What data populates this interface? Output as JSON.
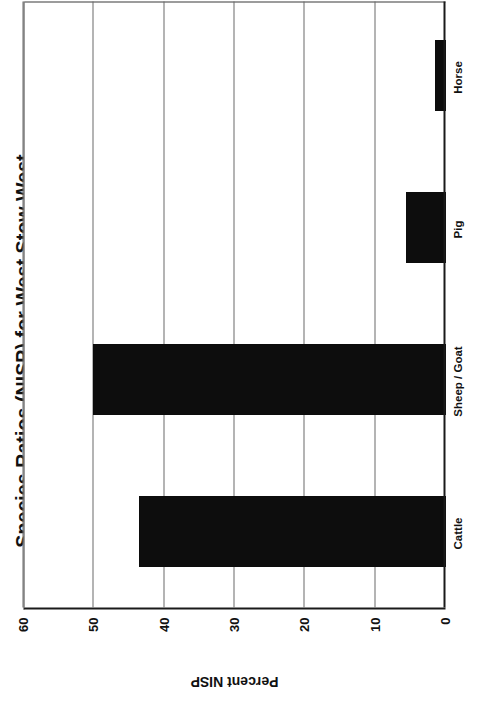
{
  "chart_data": {
    "type": "bar",
    "orientation": "horizontal",
    "title": "Species Ratios (NISP) for West Stow West",
    "xlabel": "",
    "ylabel": "Percent NISP",
    "categories": [
      "Cattle",
      "Sheep / Goat",
      "Pig",
      "Horse"
    ],
    "values": [
      43.5,
      50.0,
      5.6,
      1.4
    ],
    "series": [
      {
        "name": "Percent NISP",
        "values": [
          43.5,
          50.0,
          5.6,
          1.4
        ]
      }
    ],
    "value_axis": {
      "label": "Percent NISP",
      "min": 0,
      "max": 60,
      "tick_step": 10,
      "ticks": [
        0,
        10,
        20,
        30,
        40,
        50,
        60
      ],
      "tick_labels": [
        "0",
        "10",
        "20",
        "30",
        "40",
        "50",
        "60"
      ]
    },
    "category_axis": {
      "label": "",
      "tick_labels": [
        "Cattle",
        "Sheep / Goat",
        "Pig",
        "Horse"
      ]
    },
    "grid": {
      "value_gridlines": true,
      "category_gridlines": false
    },
    "legend": {
      "visible": false,
      "position": "none",
      "entries": []
    },
    "colors": {
      "bar_fill": "#0d0d0d",
      "grid": "#6a6a6a",
      "axis": "#1a1a1a",
      "text": "#111111",
      "background": "#ffffff"
    },
    "annotations": [],
    "page": {
      "rotation_degrees": -90,
      "note": "Figure printed sideways on the scanned page"
    }
  }
}
